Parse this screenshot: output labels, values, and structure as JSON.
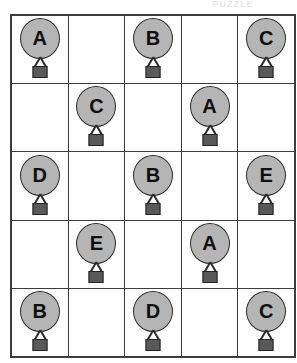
{
  "page": {
    "clipped_title": "PUZZLE",
    "background_color": "#ffffff"
  },
  "grid": {
    "rows": 5,
    "columns": 5,
    "border_color": "#3c3c3c",
    "cell_background": "#ffffff"
  },
  "icon": {
    "name": "balloon-with-weight-icon",
    "balloon_fill": "#b5b5b5",
    "balloon_stroke": "#2b2b2b",
    "weight_fill": "#595959",
    "weight_stroke": "#232323",
    "letter_color": "#101010"
  },
  "cells": [
    [
      {
        "letter": "A",
        "filled": true
      },
      {
        "letter": "",
        "filled": false
      },
      {
        "letter": "B",
        "filled": true
      },
      {
        "letter": "",
        "filled": false
      },
      {
        "letter": "C",
        "filled": true
      }
    ],
    [
      {
        "letter": "",
        "filled": false
      },
      {
        "letter": "C",
        "filled": true
      },
      {
        "letter": "",
        "filled": false
      },
      {
        "letter": "A",
        "filled": true
      },
      {
        "letter": "",
        "filled": false
      }
    ],
    [
      {
        "letter": "D",
        "filled": true
      },
      {
        "letter": "",
        "filled": false
      },
      {
        "letter": "B",
        "filled": true
      },
      {
        "letter": "",
        "filled": false
      },
      {
        "letter": "E",
        "filled": true
      }
    ],
    [
      {
        "letter": "",
        "filled": false
      },
      {
        "letter": "E",
        "filled": true
      },
      {
        "letter": "",
        "filled": false
      },
      {
        "letter": "A",
        "filled": true
      },
      {
        "letter": "",
        "filled": false
      }
    ],
    [
      {
        "letter": "B",
        "filled": true
      },
      {
        "letter": "",
        "filled": false
      },
      {
        "letter": "D",
        "filled": true
      },
      {
        "letter": "",
        "filled": false
      },
      {
        "letter": "C",
        "filled": true
      }
    ]
  ]
}
